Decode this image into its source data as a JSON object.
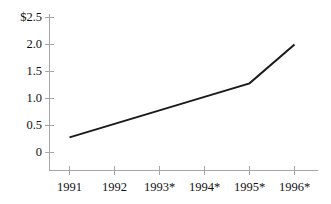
{
  "chart_data": {
    "type": "line",
    "title": "",
    "subtitle": "",
    "xlabel": "",
    "ylabel": "",
    "categories": [
      "1991",
      "1992",
      "1993*",
      "1994*",
      "1995*",
      "1996*"
    ],
    "x": [
      1991,
      1992,
      1993,
      1994,
      1995,
      1996
    ],
    "values": [
      0.28,
      0.53,
      0.78,
      1.03,
      1.28,
      2.0
    ],
    "series": [
      {
        "name": "",
        "values": [
          0.28,
          0.53,
          0.78,
          1.03,
          1.28,
          2.0
        ]
      }
    ],
    "ylim": [
      0,
      2.5
    ],
    "yticks": [
      0,
      0.5,
      1.0,
      1.5,
      2.0,
      2.5
    ],
    "ytick_labels": [
      "0",
      "0.5",
      "1.0",
      "1.5",
      "2.0",
      "$2.5"
    ],
    "xtick_labels": [
      "1991",
      "1992",
      "1993*",
      "1994*",
      "1995*",
      "1996*"
    ],
    "grid": false,
    "legend": false,
    "legend_position": "none",
    "annotations": [],
    "currency_symbol": "$",
    "line_color": "#1a1a1a",
    "axis_color": "#9a9a9a",
    "background_color": "#ffffff"
  }
}
